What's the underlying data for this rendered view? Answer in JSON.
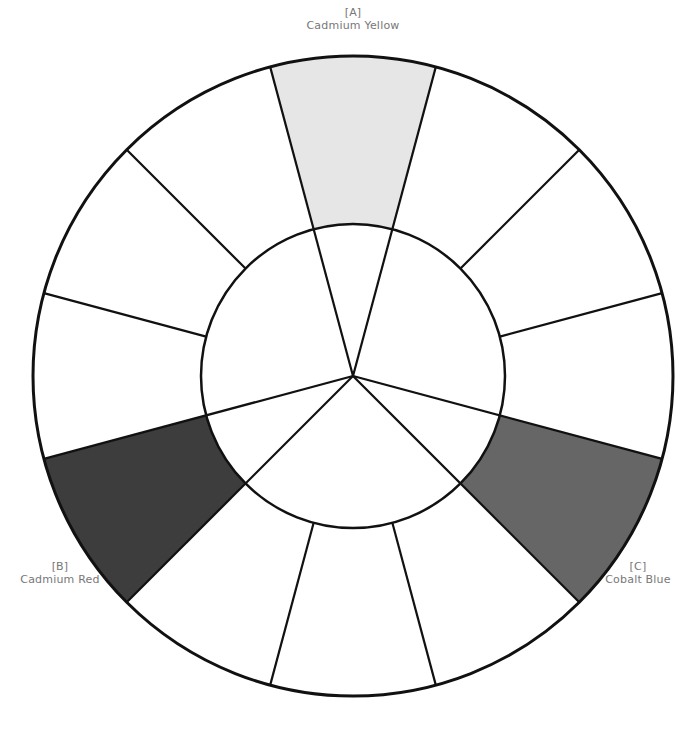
{
  "diagram": {
    "type": "color-wheel",
    "segment_count": 12,
    "center": [
      353,
      376
    ],
    "outer_radius": 320,
    "inner_radius": 152,
    "stroke_color": "#111111",
    "background_color": "#ffffff",
    "primaries": [
      {
        "code": "[A]",
        "name": "Cadmium Yellow",
        "start_angle": 75,
        "end_angle": 105,
        "fill": "#e6e6e6"
      },
      {
        "code": "[B]",
        "name": "Cadmium Red",
        "start_angle": 195,
        "end_angle": 225,
        "fill": "#3d3d3d"
      },
      {
        "code": "[C]",
        "name": "Cobalt Blue",
        "start_angle": 315,
        "end_angle": 345,
        "fill": "#666666"
      }
    ]
  },
  "labels": {
    "a": {
      "code": "[A]",
      "name": "Cadmium Yellow"
    },
    "b": {
      "code": "[B]",
      "name": "Cadmium Red"
    },
    "c": {
      "code": "[C]",
      "name": "Cobalt Blue"
    }
  }
}
